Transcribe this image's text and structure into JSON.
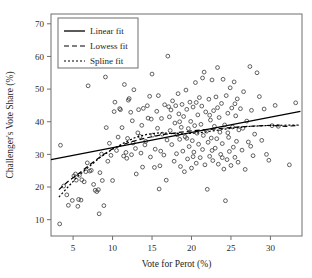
{
  "chart_data": {
    "type": "scatter",
    "title": "",
    "xlabel": "Vote for Perot (%)",
    "ylabel": "Challenger's Vote Share (%)",
    "xlim": [
      2.2,
      34.0
    ],
    "ylim": [
      5.0,
      73.0
    ],
    "xticks": [
      5,
      10,
      15,
      20,
      25,
      30
    ],
    "yticks": [
      10,
      20,
      30,
      40,
      50,
      60,
      70
    ],
    "grid": false,
    "legend_position": "top-left",
    "marker_style": "open-circle",
    "legend": [
      {
        "label": "Linear fit",
        "style": "solid"
      },
      {
        "label": "Lowess fit",
        "style": "dashed"
      },
      {
        "label": "Spline fit",
        "style": "dotted"
      }
    ],
    "points": [
      [
        3.3,
        8.7
      ],
      [
        3.4,
        32.8
      ],
      [
        3.8,
        20.3
      ],
      [
        4.2,
        17.6
      ],
      [
        4.4,
        14.4
      ],
      [
        4.9,
        15.9
      ],
      [
        5.1,
        23.4
      ],
      [
        5.3,
        24.0
      ],
      [
        5.4,
        22.1
      ],
      [
        5.6,
        14.1
      ],
      [
        5.7,
        16.2
      ],
      [
        5.8,
        23.6
      ],
      [
        6.0,
        16.0
      ],
      [
        6.1,
        22.2
      ],
      [
        6.4,
        21.6
      ],
      [
        6.6,
        24.7
      ],
      [
        6.8,
        27.4
      ],
      [
        6.9,
        51.0
      ],
      [
        7.1,
        24.9
      ],
      [
        7.3,
        25.1
      ],
      [
        7.6,
        20.8
      ],
      [
        7.8,
        19.0
      ],
      [
        8.0,
        18.6
      ],
      [
        8.2,
        19.2
      ],
      [
        8.3,
        11.8
      ],
      [
        8.4,
        24.4
      ],
      [
        8.6,
        30.1
      ],
      [
        8.7,
        22.0
      ],
      [
        8.9,
        14.3
      ],
      [
        9.1,
        53.7
      ],
      [
        9.2,
        38.2
      ],
      [
        9.4,
        27.9
      ],
      [
        9.6,
        33.4
      ],
      [
        9.8,
        29.7
      ],
      [
        10.0,
        22.0
      ],
      [
        10.2,
        43.1
      ],
      [
        10.3,
        46.0
      ],
      [
        10.5,
        31.2
      ],
      [
        10.7,
        35.3
      ],
      [
        10.9,
        44.0
      ],
      [
        11.0,
        43.7
      ],
      [
        11.2,
        38.2
      ],
      [
        11.4,
        29.5
      ],
      [
        11.5,
        51.4
      ],
      [
        11.7,
        30.6
      ],
      [
        11.8,
        28.8
      ],
      [
        12.0,
        46.6
      ],
      [
        12.1,
        47.1
      ],
      [
        12.3,
        42.9
      ],
      [
        12.4,
        29.9
      ],
      [
        12.6,
        33.5
      ],
      [
        12.7,
        49.8
      ],
      [
        12.9,
        31.8
      ],
      [
        13.0,
        24.0
      ],
      [
        13.2,
        36.6
      ],
      [
        13.3,
        43.7
      ],
      [
        13.5,
        35.5
      ],
      [
        13.6,
        30.4
      ],
      [
        13.8,
        26.1
      ],
      [
        13.9,
        44.1
      ],
      [
        14.1,
        32.9
      ],
      [
        14.2,
        34.0
      ],
      [
        14.4,
        44.9
      ],
      [
        14.5,
        41.1
      ],
      [
        14.7,
        47.8
      ],
      [
        14.8,
        29.2
      ],
      [
        15.0,
        54.6
      ],
      [
        15.1,
        35.9
      ],
      [
        15.3,
        26.0
      ],
      [
        15.4,
        31.6
      ],
      [
        15.6,
        43.2
      ],
      [
        15.7,
        38.0
      ],
      [
        15.9,
        19.4
      ],
      [
        16.0,
        26.5
      ],
      [
        16.2,
        41.0
      ],
      [
        16.3,
        36.2
      ],
      [
        16.5,
        29.8
      ],
      [
        16.6,
        45.2
      ],
      [
        16.8,
        22.1
      ],
      [
        16.9,
        34.4
      ],
      [
        17.0,
        60.1
      ],
      [
        17.1,
        44.6
      ],
      [
        17.3,
        37.3
      ],
      [
        17.4,
        43.6
      ],
      [
        17.5,
        33.0
      ],
      [
        17.6,
        46.4
      ],
      [
        17.8,
        27.9
      ],
      [
        17.9,
        39.6
      ],
      [
        18.0,
        44.9
      ],
      [
        18.1,
        30.2
      ],
      [
        18.2,
        36.0
      ],
      [
        18.3,
        48.6
      ],
      [
        18.4,
        42.4
      ],
      [
        18.5,
        34.6
      ],
      [
        18.6,
        26.3
      ],
      [
        18.7,
        38.3
      ],
      [
        18.8,
        45.3
      ],
      [
        18.9,
        31.0
      ],
      [
        19.0,
        41.6
      ],
      [
        19.1,
        24.7
      ],
      [
        19.2,
        35.4
      ],
      [
        19.3,
        49.7
      ],
      [
        19.4,
        43.8
      ],
      [
        19.5,
        28.6
      ],
      [
        19.6,
        37.9
      ],
      [
        19.7,
        32.4
      ],
      [
        19.8,
        46.0
      ],
      [
        19.9,
        40.1
      ],
      [
        20.0,
        25.8
      ],
      [
        20.1,
        34.2
      ],
      [
        20.2,
        44.5
      ],
      [
        20.3,
        30.7
      ],
      [
        20.4,
        38.8
      ],
      [
        20.5,
        52.0
      ],
      [
        20.6,
        27.3
      ],
      [
        20.7,
        36.5
      ],
      [
        20.8,
        42.1
      ],
      [
        20.9,
        33.1
      ],
      [
        21.0,
        47.4
      ],
      [
        21.1,
        29.0
      ],
      [
        21.2,
        39.2
      ],
      [
        21.3,
        44.8
      ],
      [
        21.4,
        31.5
      ],
      [
        21.5,
        35.8
      ],
      [
        21.6,
        55.2
      ],
      [
        21.7,
        26.8
      ],
      [
        21.8,
        43.0
      ],
      [
        21.9,
        37.1
      ],
      [
        22.0,
        19.3
      ],
      [
        22.1,
        33.7
      ],
      [
        22.2,
        46.9
      ],
      [
        22.3,
        29.4
      ],
      [
        22.4,
        40.5
      ],
      [
        22.5,
        35.0
      ],
      [
        22.6,
        52.8
      ],
      [
        22.7,
        28.1
      ],
      [
        22.8,
        43.4
      ],
      [
        22.9,
        38.6
      ],
      [
        23.0,
        31.9
      ],
      [
        23.1,
        47.6
      ],
      [
        23.2,
        34.8
      ],
      [
        23.3,
        56.6
      ],
      [
        23.4,
        27.0
      ],
      [
        23.5,
        41.3
      ],
      [
        23.6,
        36.8
      ],
      [
        23.7,
        30.0
      ],
      [
        23.8,
        45.6
      ],
      [
        23.9,
        33.3
      ],
      [
        24.0,
        53.0
      ],
      [
        24.1,
        25.5
      ],
      [
        24.2,
        39.0
      ],
      [
        24.3,
        15.8
      ],
      [
        24.4,
        48.0
      ],
      [
        24.5,
        28.4
      ],
      [
        24.6,
        42.6
      ],
      [
        24.7,
        35.2
      ],
      [
        24.8,
        30.9
      ],
      [
        24.9,
        50.4
      ],
      [
        25.0,
        26.6
      ],
      [
        25.1,
        44.2
      ],
      [
        25.2,
        38.4
      ],
      [
        25.3,
        32.2
      ],
      [
        25.4,
        52.2
      ],
      [
        25.5,
        29.1
      ],
      [
        25.6,
        41.8
      ],
      [
        25.7,
        34.0
      ],
      [
        25.8,
        47.0
      ],
      [
        25.9,
        27.6
      ],
      [
        26.0,
        37.5
      ],
      [
        26.2,
        44.0
      ],
      [
        26.4,
        31.3
      ],
      [
        26.6,
        49.2
      ],
      [
        26.8,
        25.4
      ],
      [
        27.0,
        40.2
      ],
      [
        27.2,
        33.8
      ],
      [
        27.4,
        56.9
      ],
      [
        27.6,
        43.5
      ],
      [
        27.8,
        29.6
      ],
      [
        28.0,
        36.2
      ],
      [
        28.3,
        55.0
      ],
      [
        28.6,
        47.7
      ],
      [
        28.9,
        34.3
      ],
      [
        29.2,
        43.9
      ],
      [
        29.5,
        30.0
      ],
      [
        29.8,
        28.2
      ],
      [
        30.2,
        38.8
      ],
      [
        30.6,
        45.0
      ],
      [
        31.0,
        38.6
      ],
      [
        32.4,
        26.8
      ],
      [
        33.2,
        45.8
      ],
      [
        12.5,
        40.3
      ],
      [
        13.7,
        38.9
      ],
      [
        14.9,
        40.8
      ],
      [
        16.1,
        31.0
      ],
      [
        17.2,
        41.5
      ],
      [
        18.5,
        40.0
      ],
      [
        19.4,
        34.9
      ],
      [
        20.6,
        45.9
      ],
      [
        21.4,
        53.4
      ],
      [
        22.3,
        42.0
      ],
      [
        23.3,
        44.3
      ],
      [
        24.6,
        36.6
      ],
      [
        25.5,
        45.5
      ],
      [
        26.5,
        38.0
      ],
      [
        27.5,
        32.5
      ],
      [
        11.9,
        34.9
      ],
      [
        15.8,
        48.0
      ],
      [
        22.6,
        31.2
      ],
      [
        20.2,
        29.3
      ],
      [
        23.9,
        29.0
      ]
    ],
    "fits": {
      "linear": {
        "x": [
          2.2,
          33.8
        ],
        "y": [
          28.4,
          43.2
        ]
      },
      "lowess": {
        "x": [
          3.2,
          4.5,
          5.6,
          7.0,
          8.5,
          10.0,
          12.0,
          14.0,
          16.0,
          18.0,
          20.0,
          22.0,
          24.0,
          26.0,
          28.0,
          30.0,
          32.0,
          33.6
        ],
        "y": [
          19.2,
          22.0,
          23.9,
          26.6,
          29.4,
          31.7,
          33.6,
          34.9,
          35.9,
          36.6,
          37.2,
          37.6,
          38.0,
          38.4,
          38.7,
          38.9,
          38.6,
          38.9
        ]
      },
      "spline": {
        "x": [
          3.2,
          4.5,
          5.6,
          7.0,
          8.5,
          10.0,
          11.5,
          13.0,
          14.5,
          16.0,
          17.5,
          19.0,
          21.0,
          23.0,
          25.0,
          27.0,
          29.0,
          31.0,
          33.6
        ],
        "y": [
          16.9,
          20.4,
          23.3,
          26.2,
          29.2,
          31.6,
          33.6,
          35.3,
          36.2,
          36.6,
          36.4,
          36.3,
          36.6,
          37.3,
          38.0,
          38.5,
          38.8,
          38.9,
          39.0
        ]
      }
    }
  }
}
